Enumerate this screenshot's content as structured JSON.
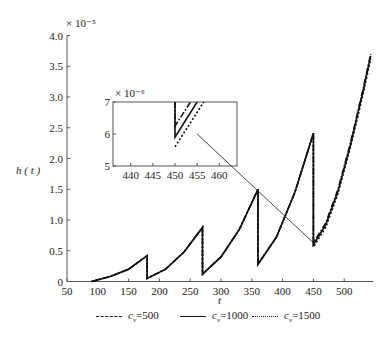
{
  "chart_data": {
    "type": "line",
    "title": "",
    "xlabel": "t",
    "ylabel": "h ( t )",
    "y_multiplier": "× 10⁻⁵",
    "xlim": [
      50,
      547
    ],
    "ylim": [
      0,
      4.0
    ],
    "x_ticks": [
      50,
      100,
      150,
      200,
      250,
      300,
      350,
      400,
      450,
      500
    ],
    "y_ticks": [
      0,
      0.5,
      1.0,
      1.5,
      2.0,
      2.5,
      3.0,
      3.5,
      4.0
    ],
    "y_tick_labels": [
      "0",
      "0.5",
      "1.0",
      "1.5",
      "2.0",
      "2.5",
      "3.0",
      "3.5",
      "4.0"
    ],
    "grid": false,
    "legend_position": "bottom",
    "series": [
      {
        "name": "c_v=500",
        "label_prefix": "c",
        "label_sub": "v",
        "label_suffix": "=500",
        "style": "dashdot",
        "points": [
          [
            90,
            0
          ],
          [
            120,
            0.08
          ],
          [
            150,
            0.2
          ],
          [
            180,
            0.42
          ],
          [
            180,
            0.05
          ],
          [
            210,
            0.2
          ],
          [
            240,
            0.48
          ],
          [
            270,
            0.88
          ],
          [
            270,
            0.12
          ],
          [
            300,
            0.4
          ],
          [
            330,
            0.85
          ],
          [
            360,
            1.5
          ],
          [
            360,
            0.28
          ],
          [
            390,
            0.72
          ],
          [
            420,
            1.45
          ],
          [
            450,
            2.41
          ],
          [
            450,
            0.63
          ],
          [
            470,
            0.95
          ],
          [
            490,
            1.5
          ],
          [
            510,
            2.25
          ],
          [
            530,
            3.1
          ],
          [
            543,
            3.7
          ]
        ]
      },
      {
        "name": "c_v=1000",
        "label_prefix": "c",
        "label_sub": "v",
        "label_suffix": "=1000",
        "style": "solid",
        "points": [
          [
            90,
            0
          ],
          [
            120,
            0.08
          ],
          [
            150,
            0.2
          ],
          [
            180,
            0.42
          ],
          [
            180,
            0.05
          ],
          [
            210,
            0.2
          ],
          [
            240,
            0.48
          ],
          [
            270,
            0.88
          ],
          [
            270,
            0.12
          ],
          [
            300,
            0.4
          ],
          [
            330,
            0.85
          ],
          [
            360,
            1.5
          ],
          [
            360,
            0.28
          ],
          [
            390,
            0.72
          ],
          [
            420,
            1.45
          ],
          [
            450,
            2.41
          ],
          [
            450,
            0.6
          ],
          [
            470,
            0.92
          ],
          [
            490,
            1.47
          ],
          [
            510,
            2.22
          ],
          [
            530,
            3.07
          ],
          [
            543,
            3.67
          ]
        ]
      },
      {
        "name": "c_v=1500",
        "label_prefix": "c",
        "label_sub": "v",
        "label_suffix": "=1500",
        "style": "dotted",
        "points": [
          [
            90,
            0
          ],
          [
            120,
            0.08
          ],
          [
            150,
            0.2
          ],
          [
            180,
            0.42
          ],
          [
            180,
            0.05
          ],
          [
            210,
            0.2
          ],
          [
            240,
            0.48
          ],
          [
            270,
            0.88
          ],
          [
            270,
            0.12
          ],
          [
            300,
            0.4
          ],
          [
            330,
            0.85
          ],
          [
            360,
            1.5
          ],
          [
            360,
            0.28
          ],
          [
            390,
            0.72
          ],
          [
            420,
            1.45
          ],
          [
            450,
            2.41
          ],
          [
            450,
            0.56
          ],
          [
            470,
            0.88
          ],
          [
            490,
            1.43
          ],
          [
            510,
            2.18
          ],
          [
            530,
            3.02
          ],
          [
            543,
            3.62
          ]
        ]
      }
    ],
    "inset": {
      "y_multiplier": "× 10⁻⁶",
      "xlim": [
        436,
        464
      ],
      "ylim": [
        5,
        7
      ],
      "x_ticks": [
        440,
        445,
        450,
        455,
        460
      ],
      "y_ticks": [
        5,
        6,
        7
      ],
      "series": [
        {
          "name": "c_v=500",
          "style": "dashdot",
          "points": [
            [
              450,
              7
            ],
            [
              450,
              6.25
            ],
            [
              453.5,
              7
            ]
          ]
        },
        {
          "name": "c_v=1000",
          "style": "solid",
          "points": [
            [
              450,
              7
            ],
            [
              450,
              5.9
            ],
            [
              455,
              7
            ]
          ]
        },
        {
          "name": "c_v=1500",
          "style": "dotted",
          "points": [
            [
              450,
              5.6
            ],
            [
              456.5,
              7
            ]
          ]
        }
      ],
      "connector_from": [
        455,
        6.0
      ],
      "connector_to": [
        450,
        0.63
      ]
    }
  }
}
